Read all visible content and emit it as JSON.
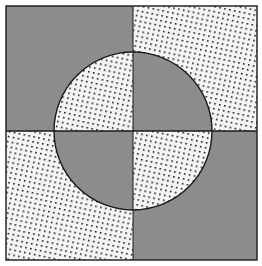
{
  "figure": {
    "colors": {
      "gray": "#8c8c8c",
      "stipple_bg": "#f4f4f4",
      "stipple_dot": "#1a1a1a",
      "outline": "#1a1a1a",
      "page": "#ffffff"
    },
    "square": {
      "x": 6,
      "y": 6,
      "width": 251,
      "height": 254
    },
    "center": {
      "x": 133,
      "y": 131
    },
    "circle_radius": 79,
    "quadrants": [
      {
        "name": "top-left",
        "outside_circle": "gray",
        "inside_circle": "stipple"
      },
      {
        "name": "top-right",
        "outside_circle": "stipple",
        "inside_circle": "gray"
      },
      {
        "name": "bottom-left",
        "outside_circle": "stipple",
        "inside_circle": "gray"
      },
      {
        "name": "bottom-right",
        "outside_circle": "gray",
        "inside_circle": "stipple"
      }
    ]
  }
}
